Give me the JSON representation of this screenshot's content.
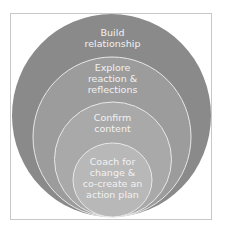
{
  "diagram": {
    "type": "nested-circles",
    "colors": {
      "frame_border": "#c8c8c8",
      "background": "#ffffff",
      "circle_stroke": "#e8e8e8",
      "text": "#f2f2f2"
    },
    "layers": [
      {
        "level": 1,
        "lines": [
          "Build",
          "relationship"
        ],
        "fill": "#8a8a8a"
      },
      {
        "level": 2,
        "lines": [
          "Explore",
          "reaction &",
          "reflections"
        ],
        "fill": "#9c9c9c"
      },
      {
        "level": 3,
        "lines": [
          "Confirm",
          "content"
        ],
        "fill": "#a9a9a9"
      },
      {
        "level": 4,
        "lines": [
          "Coach for",
          "change &",
          "co-create an",
          "action plan"
        ],
        "fill": "#b8b8b8"
      }
    ]
  }
}
